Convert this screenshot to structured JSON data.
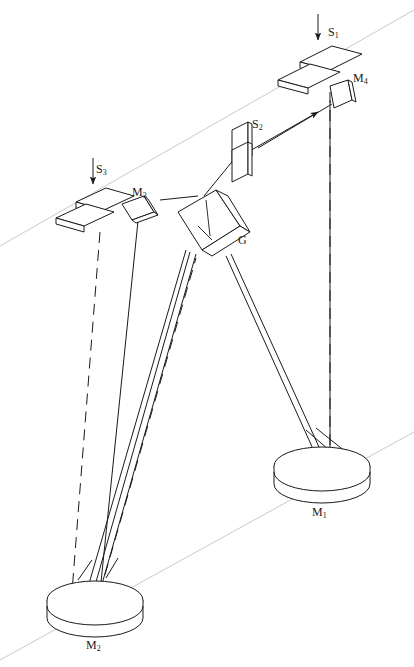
{
  "figure": {
    "kind": "optical-ray-diagram",
    "background_color": "#ffffff",
    "line_color": "#1a1a1a",
    "guide_color": "#c8c8c8"
  },
  "labels": {
    "s1": "S",
    "s1_sub": "1",
    "s2": "S",
    "s2_sub": "2",
    "s3": "S",
    "s3_sub": "3",
    "m1": "M",
    "m1_sub": "1",
    "m2": "M",
    "m2_sub": "2",
    "m3": "M",
    "m3_sub": "3",
    "m4": "M",
    "m4_sub": "4",
    "g": "G"
  },
  "components": [
    {
      "id": "s1",
      "name": "entrance-slit",
      "label": "S1",
      "type": "slit-jaws",
      "x": 316,
      "y": 58
    },
    {
      "id": "s2",
      "name": "intermediate-slit",
      "label": "S2",
      "type": "slit-jaws-vertical",
      "x": 242,
      "y": 145
    },
    {
      "id": "s3",
      "name": "exit-slit",
      "label": "S3",
      "type": "slit-jaws",
      "x": 88,
      "y": 200
    },
    {
      "id": "m1",
      "name": "collimating-mirror",
      "label": "M1",
      "type": "concave-disc",
      "x": 322,
      "y": 474
    },
    {
      "id": "m2",
      "name": "camera-mirror",
      "label": "M2",
      "type": "concave-disc",
      "x": 95,
      "y": 607
    },
    {
      "id": "m3",
      "name": "fold-mirror-three",
      "label": "M3",
      "type": "flat-plate",
      "x": 137,
      "y": 208
    },
    {
      "id": "m4",
      "name": "fold-mirror-four",
      "label": "M4",
      "type": "flat-plate",
      "x": 344,
      "y": 93
    },
    {
      "id": "g",
      "name": "diffraction-grating",
      "label": "G",
      "type": "grating-block",
      "x": 210,
      "y": 222
    }
  ],
  "label_positions": {
    "s1": {
      "x": 328,
      "y": 26
    },
    "s2": {
      "x": 252,
      "y": 118
    },
    "s3": {
      "x": 96,
      "y": 163
    },
    "m1": {
      "x": 312,
      "y": 506
    },
    "m2": {
      "x": 86,
      "y": 639
    },
    "m3": {
      "x": 132,
      "y": 186
    },
    "m4": {
      "x": 353,
      "y": 72
    },
    "g": {
      "x": 238,
      "y": 234
    }
  }
}
